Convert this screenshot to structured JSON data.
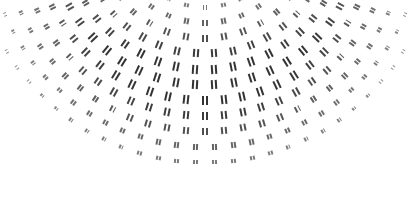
{
  "image": {
    "description": "Decorative halftone fan pattern of double-bar marks on white background",
    "width": 410,
    "height": 211,
    "background": "#ffffff",
    "mark_color": "#333333",
    "mark_glyph": "double-vertical-bar"
  },
  "pattern": {
    "center_x": 205,
    "center_y": -70,
    "radius_start": 62,
    "radius_step": 15.5,
    "rings": 12,
    "angle_min_deg": 8,
    "angle_max_deg": 172,
    "arc_spacing": 19,
    "max_bar_height": 9,
    "bar_width": 2.2,
    "bar_gap": 2,
    "peak_ring": 6
  }
}
